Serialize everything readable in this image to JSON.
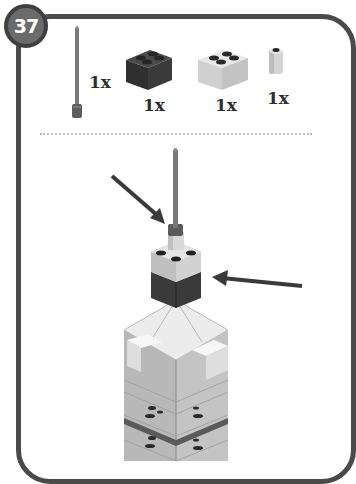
{
  "step": {
    "number": "37"
  },
  "parts_list": [
    {
      "name": "antenna",
      "quantity": "1x",
      "color": "#6e6e6e"
    },
    {
      "name": "brick-2x2-dark",
      "quantity": "1x",
      "color": "#3d3d3d"
    },
    {
      "name": "brick-2x2-light",
      "quantity": "1x",
      "color": "#d6d6d6"
    },
    {
      "name": "round-brick-1x1",
      "quantity": "1x",
      "color": "#cfcfcf"
    }
  ],
  "colors": {
    "frame": "#4a4a4a",
    "badge": "#6b6b6b",
    "arrow": "#3a3a3a",
    "tower_body": "#b5b5b5"
  }
}
